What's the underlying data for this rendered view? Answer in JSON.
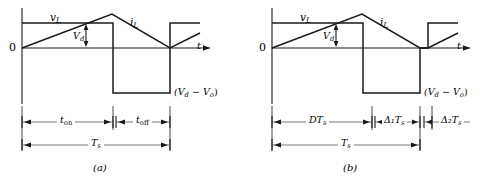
{
  "figure": {
    "line_color": "#1a1a1a",
    "background": "#ffffff"
  },
  "panels": [
    {
      "id": "a",
      "caption": "(a)",
      "axis": {
        "origin_label": "0",
        "x_axis_label": "t"
      },
      "curve_labels": [
        {
          "name": "inductor-voltage",
          "text": "v",
          "subscript": "L"
        },
        {
          "name": "inductor-current",
          "text": "i",
          "subscript": "L"
        },
        {
          "name": "diode-voltage",
          "text": "V",
          "subscript": "d"
        }
      ],
      "level_label": {
        "text": "(V",
        "sub1": "d",
        "mid": " − V",
        "sub2": "o",
        "close": ")",
        "full": "(Vd − Vo)"
      },
      "dimensions": [
        {
          "name": "t-on",
          "base": "t",
          "subscript": "on",
          "full": "t_on"
        },
        {
          "name": "t-off",
          "base": "t",
          "subscript": "off",
          "full": "t_off"
        },
        {
          "name": "t-switching-period",
          "base": "T",
          "subscript": "s",
          "full": "T_s"
        }
      ]
    },
    {
      "id": "b",
      "caption": "(b)",
      "axis": {
        "origin_label": "0",
        "x_axis_label": "t"
      },
      "curve_labels": [
        {
          "name": "inductor-voltage",
          "text": "v",
          "subscript": "L"
        },
        {
          "name": "inductor-current",
          "text": "i",
          "subscript": "L"
        },
        {
          "name": "diode-voltage",
          "text": "V",
          "subscript": "d"
        }
      ],
      "level_label": {
        "text": "(V",
        "sub1": "d",
        "mid": " − V",
        "sub2": "o",
        "close": ")",
        "full": "(Vd − Vo)"
      },
      "dimensions": [
        {
          "name": "d-ts",
          "base": "DT",
          "subscript": "s",
          "full": "DT_s"
        },
        {
          "name": "delta1-ts",
          "base": "Δ₁T",
          "subscript": "s",
          "full": "Δ1T_s"
        },
        {
          "name": "delta2-ts",
          "base": "Δ₂T",
          "subscript": "s",
          "full": "Δ2T_s"
        },
        {
          "name": "t-switching-period",
          "base": "T",
          "subscript": "s",
          "full": "T_s"
        }
      ]
    }
  ]
}
